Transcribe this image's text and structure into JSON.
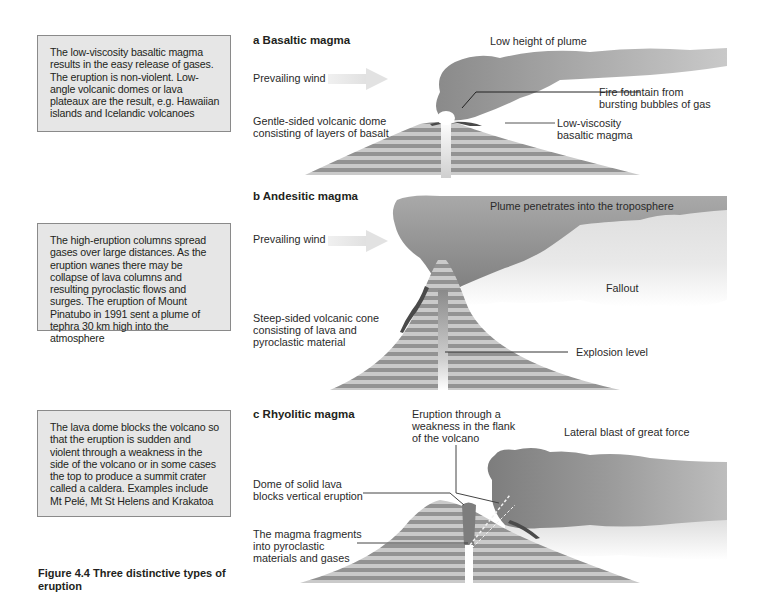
{
  "figure": {
    "caption": "Figure 4.4  Three distinctive types of eruption"
  },
  "panels": [
    {
      "id": "a",
      "heading": "a  Basaltic magma",
      "description": "The low-viscosity basaltic magma results in the easy release of gases. The eruption is non-violent. Low-angle volcanic domes or lava plateaux are the result, e.g. Hawaiian islands and Icelandic volcanoes",
      "labels": {
        "plume": "Low height of plume",
        "wind": "Prevailing wind",
        "dome_line1": "Gentle-sided volcanic dome",
        "dome_line2": "consisting of layers of basalt",
        "fountain_line1": "Fire fountain from",
        "fountain_line2": "bursting bubbles of gas",
        "magma_line1": "Low-viscosity",
        "magma_line2": "basaltic magma"
      }
    },
    {
      "id": "b",
      "heading": "b  Andesitic magma",
      "description": "The high-eruption columns spread gases over large distances. As the eruption wanes there may be collapse of lava columns and resulting pyroclastic flows and surges. The eruption of Mount Pinatubo in 1991 sent a plume of tephra 30 km high into the atmosphere",
      "labels": {
        "plume": "Plume penetrates into the troposphere",
        "wind": "Prevailing wind",
        "fallout": "Fallout",
        "cone_line1": "Steep-sided volcanic cone",
        "cone_line2": "consisting of lava and",
        "cone_line3": "pyroclastic material",
        "explosion": "Explosion level"
      }
    },
    {
      "id": "c",
      "heading": "c   Rhyolitic magma",
      "description": "The lava dome blocks the volcano so that the eruption is sudden and violent through a weakness in the side of the volcano or in some cases the top to produce a summit crater called a caldera. Examples include Mt Pelé, Mt St Helens and Krakatoa",
      "labels": {
        "flank_line1": "Eruption through a",
        "flank_line2": "weakness in the flank",
        "flank_line3": "of the volcano",
        "blast": "Lateral blast of great force",
        "dome_line1": "Dome of solid lava",
        "dome_line2": "blocks vertical eruption",
        "fragments_line1": "The magma fragments",
        "fragments_line2": "into pyroclastic",
        "fragments_line3": "materials and gases"
      }
    }
  ],
  "colors": {
    "box_fill": "#e6e6e6",
    "box_border": "#8a8a8a",
    "plume_dark": "#8c8c8c",
    "plume_light": "#d9d9d9",
    "stripe_dark": "#8f8f8f",
    "stripe_light": "#c8c8c8",
    "lava_crust": "#4a4a4a",
    "wind_arrow": "#e4e4e4"
  }
}
